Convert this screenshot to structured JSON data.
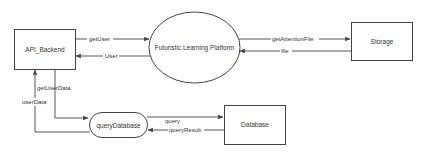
{
  "diagram": {
    "type": "data-flow",
    "nodes": {
      "api_backend": {
        "label": "API_Backend",
        "shape": "rectangle"
      },
      "platform": {
        "label": "Futuristic Learning Platform",
        "shape": "ellipse"
      },
      "storage": {
        "label": "Storage",
        "shape": "rectangle"
      },
      "query_database": {
        "label": "queryDatabase",
        "shape": "rounded-rectangle"
      },
      "database": {
        "label": "Database",
        "shape": "rectangle"
      }
    },
    "edges": {
      "get_user": {
        "label": "getUser",
        "from": "API_Backend",
        "to": "Futuristic Learning Platform"
      },
      "user": {
        "label": "User",
        "from": "Futuristic Learning Platform",
        "to": "API_Backend"
      },
      "get_attention_file": {
        "label": "getAttentionFile",
        "from": "Futuristic Learning Platform",
        "to": "Storage"
      },
      "file": {
        "label": "file",
        "from": "Storage",
        "to": "Futuristic Learning Platform"
      },
      "get_user_data": {
        "label": "getUserData",
        "from": "API_Backend",
        "to": "queryDatabase"
      },
      "user_data": {
        "label": "userData",
        "from": "queryDatabase",
        "to": "API_Backend"
      },
      "query": {
        "label": "query",
        "from": "queryDatabase",
        "to": "Database"
      },
      "query_result": {
        "label": "queryResult",
        "from": "Database",
        "to": "queryDatabase"
      }
    },
    "colors": {
      "stroke": "#444444",
      "text": "#333333",
      "background": "#ffffff"
    }
  }
}
